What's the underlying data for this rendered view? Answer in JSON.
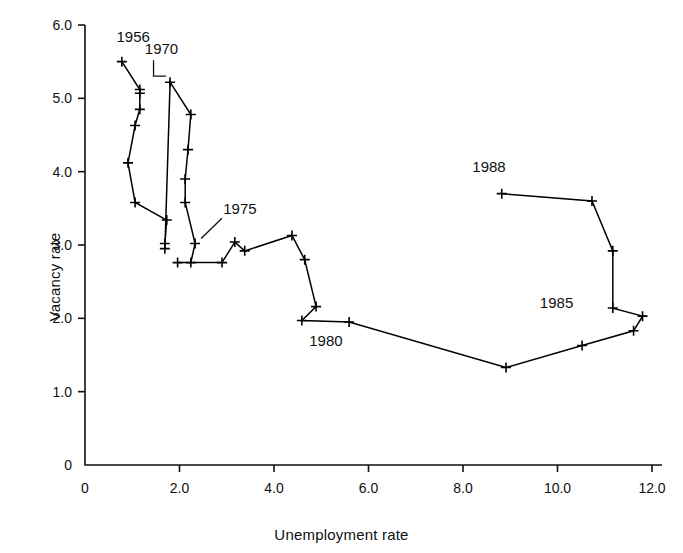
{
  "chart_data": {
    "type": "line",
    "title": "",
    "subtitle": "",
    "xlabel": "Unemployment rate",
    "ylabel": "Vacancy rate",
    "xlim": [
      0,
      12.4
    ],
    "ylim": [
      0,
      6.0
    ],
    "xticks": [
      0,
      2.0,
      4.0,
      6.0,
      8.0,
      10.0,
      12.0
    ],
    "xticklabels": [
      "0",
      "2.0",
      "4.0",
      "6.0",
      "8.0",
      "10.0",
      "12.0"
    ],
    "yticks": [
      0,
      1.0,
      2.0,
      3.0,
      4.0,
      5.0,
      6.0
    ],
    "yticklabels": [
      "0",
      "1.0",
      "2.0",
      "3.0",
      "4.0",
      "5.0",
      "6.0"
    ],
    "grid": false,
    "legend": false,
    "marker": "plus",
    "line_color": "#000000",
    "series": [
      {
        "name": "UK Beveridge curve 1956-1988",
        "x": [
          0.78,
          1.16,
          1.16,
          1.16,
          1.06,
          0.91,
          1.06,
          1.73,
          1.69,
          1.69,
          1.8,
          2.24,
          2.18,
          2.12,
          2.12,
          2.33,
          2.24,
          1.96,
          2.9,
          3.17,
          3.38,
          4.38,
          4.65,
          4.89,
          4.59,
          5.59,
          8.91,
          10.52,
          11.61,
          11.8,
          11.17,
          11.17,
          10.73,
          8.82
        ],
        "y": [
          5.5,
          5.12,
          5.07,
          4.85,
          4.63,
          4.12,
          3.58,
          3.34,
          3.02,
          2.95,
          5.22,
          4.78,
          4.3,
          3.9,
          3.58,
          3.02,
          2.76,
          2.76,
          2.76,
          3.04,
          2.92,
          3.13,
          2.8,
          2.16,
          1.97,
          1.95,
          1.33,
          1.63,
          1.83,
          2.03,
          2.14,
          2.92,
          3.6,
          3.7
        ],
        "years": [
          1956,
          1957,
          1958,
          1959,
          1960,
          1961,
          1962,
          1963,
          1964,
          1965,
          1970,
          1971,
          1972,
          1973,
          1974,
          1975,
          1976,
          1977,
          1978,
          1979,
          1980,
          1981,
          1982,
          1983,
          1984,
          1985,
          1986,
          1987,
          1988,
          1989,
          1990,
          1991,
          1992,
          1993
        ]
      }
    ],
    "annotations": [
      {
        "label": "1956",
        "x": 0.78,
        "y": 5.5,
        "text_x": 1.02,
        "text_y": 5.77,
        "leader": false
      },
      {
        "label": "1970",
        "x": 1.8,
        "y": 5.22,
        "text_x": 1.62,
        "text_y": 5.6,
        "leader": true
      },
      {
        "label": "1975",
        "x": 2.33,
        "y": 3.02,
        "text_x": 3.28,
        "text_y": 3.42,
        "leader": true
      },
      {
        "label": "1980",
        "x": 5.59,
        "y": 1.95,
        "text_x": 5.1,
        "text_y": 1.62,
        "leader": false
      },
      {
        "label": "1985",
        "x": 11.17,
        "y": 2.14,
        "text_x": 9.98,
        "text_y": 2.14,
        "leader": false
      },
      {
        "label": "1988",
        "x": 8.82,
        "y": 3.7,
        "text_x": 8.55,
        "text_y": 4.0,
        "leader": false
      }
    ]
  }
}
